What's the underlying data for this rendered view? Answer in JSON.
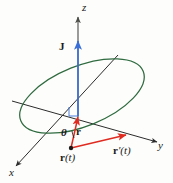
{
  "figure": {
    "background_color": "#fdfdfc",
    "axes": [
      {
        "name": "z",
        "label": "z",
        "direction": "up",
        "color": "#4a4a46"
      },
      {
        "name": "x",
        "label": "x",
        "direction": "down-left",
        "color": "#2b2b2b"
      },
      {
        "name": "y",
        "label": "y",
        "direction": "right",
        "color": "#2b2b2b"
      }
    ],
    "vectors": [
      {
        "name": "J",
        "label": "J",
        "color": "#3a6fd8",
        "description": "angular momentum vector along z axis"
      },
      {
        "name": "r",
        "label": "r",
        "color": "#e02b20",
        "description": "position vector from origin to point on orbit"
      },
      {
        "name": "r-prime",
        "label": "r'(t)",
        "label_bold": "r",
        "label_rest": "'(t)",
        "color": "#e02b20",
        "description": "velocity vector tangent to orbit"
      }
    ],
    "points": [
      {
        "name": "r-of-t",
        "label": "r(t)",
        "label_bold": "r",
        "label_rest": "(t)",
        "color": "#1a1a1a"
      }
    ],
    "angle": {
      "name": "theta",
      "label": "θ",
      "color": "#1a1a1a"
    },
    "orbit": {
      "name": "orbit-ellipse",
      "color": "#2f6b3f",
      "description": "green tilted elliptical orbit"
    },
    "right_angle_marker": {
      "name": "right-angle-marker",
      "color": "#3a6fd8"
    },
    "labels": {
      "z": "z",
      "x": "x",
      "y": "y",
      "J": "J",
      "r": "r",
      "theta": "θ",
      "r_of_t_bold": "r",
      "r_of_t_rest": "(t)",
      "r_prime_bold": "r",
      "r_prime_rest": "′(t)"
    }
  }
}
